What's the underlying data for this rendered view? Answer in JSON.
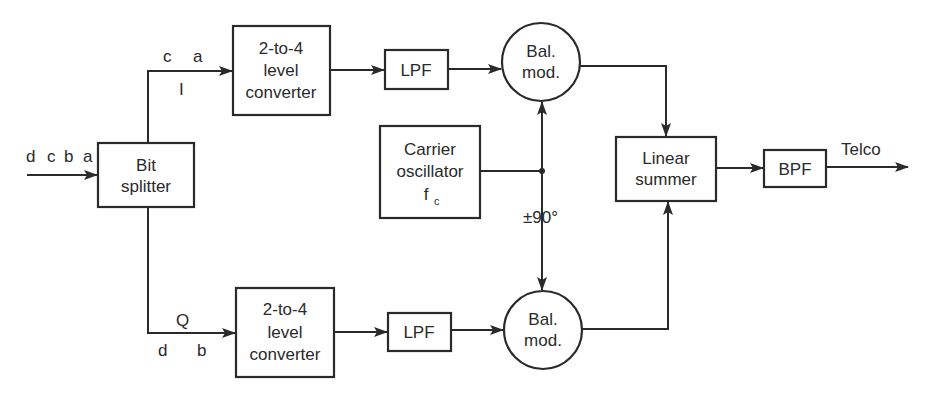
{
  "diagram": {
    "type": "block-diagram",
    "blocks": {
      "bit_splitter": {
        "line1": "Bit",
        "line2": "splitter"
      },
      "conv_i": {
        "line1": "2-to-4",
        "line2": "level",
        "line3": "converter"
      },
      "conv_q": {
        "line1": "2-to-4",
        "line2": "level",
        "line3": "converter"
      },
      "lpf_i": {
        "label": "LPF"
      },
      "lpf_q": {
        "label": "LPF"
      },
      "mod_i": {
        "line1": "Bal.",
        "line2": "mod."
      },
      "mod_q": {
        "line1": "Bal.",
        "line2": "mod."
      },
      "carrier": {
        "line1": "Carrier",
        "line2": "oscillator",
        "line3": "f",
        "line3_sub": "c"
      },
      "summer": {
        "line1": "Linear",
        "line2": "summer"
      },
      "bpf": {
        "label": "BPF"
      }
    },
    "signals": {
      "input_bits": [
        "d",
        "c",
        "b",
        "a"
      ],
      "i_bits": [
        "c",
        "a"
      ],
      "i_label": "I",
      "q_label": "Q",
      "q_bits": [
        "d",
        "b"
      ],
      "phase_shift": "±90°",
      "output": "Telco"
    }
  }
}
